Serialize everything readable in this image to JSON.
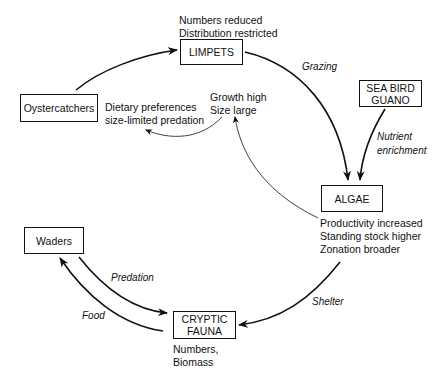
{
  "nodes": {
    "limpets": {
      "label": "LIMPETS"
    },
    "oystercatchers": {
      "label": "Oystercatchers"
    },
    "sea_bird_guano": {
      "line1": "SEA BIRD",
      "line2": "GUANO"
    },
    "algae": {
      "label": "ALGAE"
    },
    "waders": {
      "label": "Waders"
    },
    "cryptic_fauna": {
      "line1": "CRYPTIC",
      "line2": "FAUNA"
    }
  },
  "notes": {
    "limpets": [
      "Numbers reduced",
      "Distribution restricted"
    ],
    "dietary": [
      "Dietary preferences",
      "size-limited predation"
    ],
    "growth": [
      "Growth high",
      "Size large"
    ],
    "algae": [
      "Productivity increased",
      "Standing stock higher",
      "Zonation broader"
    ],
    "cryptic": [
      "Numbers,",
      "Biomass"
    ]
  },
  "edges": {
    "grazing": "Grazing",
    "nutrient": [
      "Nutrient",
      "enrichment"
    ],
    "predation": "Predation",
    "food": "Food",
    "shelter": "Shelter"
  },
  "colors": {
    "line": "#111111",
    "background": "#ffffff"
  }
}
